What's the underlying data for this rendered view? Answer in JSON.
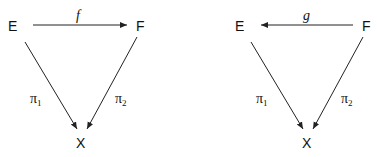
{
  "diagrams": [
    {
      "nodes": {
        "E": "E",
        "F": "F",
        "X": "X"
      },
      "top_arrow": {
        "label": "f",
        "direction": "E-to-F"
      },
      "left_arrow": {
        "label": "π",
        "sub": "1"
      },
      "right_arrow": {
        "label": "π",
        "sub": "2"
      }
    },
    {
      "nodes": {
        "E": "E",
        "F": "F",
        "X": "X"
      },
      "top_arrow": {
        "label": "g",
        "direction": "F-to-E"
      },
      "left_arrow": {
        "label": "π",
        "sub": "1"
      },
      "right_arrow": {
        "label": "π",
        "sub": "2"
      }
    }
  ]
}
